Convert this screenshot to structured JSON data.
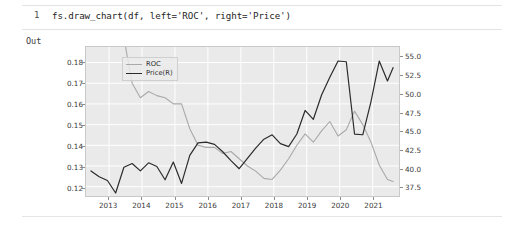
{
  "notebook": {
    "prompt": "1",
    "code": "fs.draw_chart(df, left='ROC', right='Price')",
    "out_label": "Out"
  },
  "chart_data": {
    "type": "line",
    "title": "",
    "xlabel": "",
    "ylabel": "",
    "grid": true,
    "legend_position": "upper-left",
    "colors": {
      "roc": "#a9a9a9",
      "price": "#2b2b2b",
      "plot_background": "#eaeaea",
      "gridline": "#ffffff",
      "axis_text": "#3a3a3a"
    },
    "x_axis": {
      "ticklabels": [
        "2013",
        "2014",
        "2015",
        "2016",
        "2017",
        "2018",
        "2019",
        "2020",
        "2021"
      ],
      "range": [
        2012.3,
        2021.8
      ]
    },
    "y_axis_left": {
      "label": "ROC",
      "ticklabels": [
        "0.18",
        "0.17",
        "0.16",
        "0.15",
        "0.14",
        "0.13",
        "0.12"
      ],
      "ticks": [
        0.18,
        0.17,
        0.16,
        0.15,
        0.14,
        0.13,
        0.12
      ],
      "range": [
        0.1155,
        0.1875
      ]
    },
    "y_axis_right": {
      "label": "Price(R)",
      "ticklabels": [
        "55.0",
        "52.5",
        "50.0",
        "47.5",
        "45.0",
        "42.5",
        "40.0",
        "37.5"
      ],
      "ticks": [
        55.0,
        52.5,
        50.0,
        47.5,
        45.0,
        42.5,
        40.0,
        37.5
      ],
      "range": [
        36.2,
        56.4
      ]
    },
    "series": [
      {
        "name": "ROC",
        "axis": "left",
        "color": "#a9a9a9",
        "x": [
          2012.45,
          2012.7,
          2012.95,
          2013.2,
          2013.45,
          2013.7,
          2013.95,
          2014.2,
          2014.45,
          2014.7,
          2014.95,
          2015.2,
          2015.45,
          2015.7,
          2015.95,
          2016.2,
          2016.45,
          2016.7,
          2016.95,
          2017.2,
          2017.45,
          2017.7,
          2017.95,
          2018.2,
          2018.45,
          2018.7,
          2018.95,
          2019.2,
          2019.45,
          2019.7,
          2019.95,
          2020.2,
          2020.45,
          2020.7,
          2020.95,
          2021.2,
          2021.45,
          2021.62
        ],
        "values": [
          0.205,
          0.203,
          0.201,
          0.198,
          0.192,
          0.17,
          0.163,
          0.166,
          0.164,
          0.163,
          0.16,
          0.16,
          0.148,
          0.14,
          0.139,
          0.139,
          0.136,
          0.137,
          0.1335,
          0.13,
          0.1275,
          0.124,
          0.1235,
          0.128,
          0.1335,
          0.14,
          0.1455,
          0.1415,
          0.147,
          0.1515,
          0.1445,
          0.1475,
          0.1565,
          0.15,
          0.1415,
          0.1305,
          0.1235,
          0.1225
        ],
        "visible_from_x": 2013.35
      },
      {
        "name": "Price(R)",
        "axis": "right",
        "color": "#2b2b2b",
        "x": [
          2012.45,
          2012.7,
          2012.95,
          2013.2,
          2013.45,
          2013.7,
          2013.95,
          2014.2,
          2014.45,
          2014.7,
          2014.95,
          2015.2,
          2015.45,
          2015.7,
          2015.95,
          2016.2,
          2016.45,
          2016.7,
          2016.95,
          2017.2,
          2017.45,
          2017.7,
          2017.95,
          2018.2,
          2018.45,
          2018.7,
          2018.95,
          2019.2,
          2019.45,
          2019.7,
          2019.95,
          2020.2,
          2020.45,
          2020.7,
          2020.95,
          2021.2,
          2021.45,
          2021.62
        ],
        "values": [
          39.6,
          38.8,
          38.3,
          36.6,
          40.1,
          40.6,
          39.6,
          40.7,
          40.2,
          38.4,
          40.8,
          37.9,
          41.7,
          43.4,
          43.5,
          43.2,
          42.2,
          41.0,
          39.9,
          41.3,
          42.7,
          43.9,
          44.5,
          43.3,
          42.9,
          44.6,
          47.8,
          46.6,
          49.9,
          52.3,
          54.5,
          54.4,
          44.6,
          44.5,
          49.0,
          54.5,
          51.8,
          53.6
        ]
      }
    ]
  }
}
